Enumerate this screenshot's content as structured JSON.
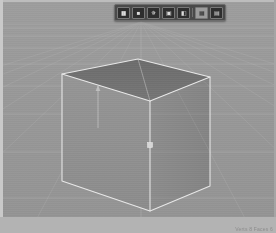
{
  "app": {
    "title": "3D Viewport",
    "background_color": "#9a9a9a",
    "frame_color": "#c9c9c9"
  },
  "toolbar": {
    "name": "floating-viewport-toolbar",
    "background_color": "#4a4a4a",
    "border_color": "#6d6d6d",
    "items": [
      {
        "label": "▮▮",
        "kind": "icon",
        "name": "tool-select-icon"
      },
      {
        "label": "■",
        "kind": "icon",
        "name": "tool-move-icon"
      },
      {
        "label": "✵",
        "kind": "icon",
        "name": "tool-rotate-icon"
      },
      {
        "label": "▣",
        "kind": "icon",
        "name": "tool-scale-icon"
      },
      {
        "label": "◧",
        "kind": "icon",
        "name": "tool-transform-icon"
      },
      {
        "label": "⬛",
        "kind": "sep",
        "name": "toolbar-separator"
      },
      {
        "label": "▦",
        "kind": "icon-light",
        "name": "shading-solid-icon"
      },
      {
        "label": "▤",
        "kind": "icon",
        "name": "shading-wire-icon"
      }
    ]
  },
  "viewport": {
    "name": "3d-viewport",
    "grid": {
      "visible": true,
      "color": "#b4b4b4",
      "horizon_color": "#a8a8a8",
      "vanishing_point": {
        "x": 138,
        "y": 20
      },
      "horizon_y": 22,
      "floor_line_count": 9,
      "radial_line_count": 13,
      "floor_lines_y": [
        26,
        34,
        46,
        62,
        84,
        112,
        150,
        196,
        252
      ],
      "radial_spread_px": 620
    },
    "object": {
      "name": "cube",
      "type": "box",
      "selected": true,
      "outline_color": "#e8e8e8",
      "face_top_color": "#6f6f6f",
      "face_left_color": "#909090",
      "face_right_color": "#888888",
      "opacity": 0.92,
      "vertices": {
        "top_back": {
          "x": 135,
          "y": 57
        },
        "top_left": {
          "x": 59,
          "y": 72
        },
        "top_right": {
          "x": 207,
          "y": 75
        },
        "top_front": {
          "x": 147,
          "y": 99
        },
        "bottom_left": {
          "x": 59,
          "y": 179
        },
        "bottom_front": {
          "x": 147,
          "y": 209
        },
        "bottom_right": {
          "x": 207,
          "y": 184
        }
      }
    },
    "gizmo": {
      "name": "transform-gizmo",
      "axis_color": "#c4c4c4",
      "arrow": {
        "x": 95,
        "y_top": 84,
        "y_bottom": 126
      },
      "handle": {
        "x": 147,
        "y": 143,
        "size": 5
      }
    }
  },
  "status": {
    "text": "Verts 8   Faces 6"
  }
}
